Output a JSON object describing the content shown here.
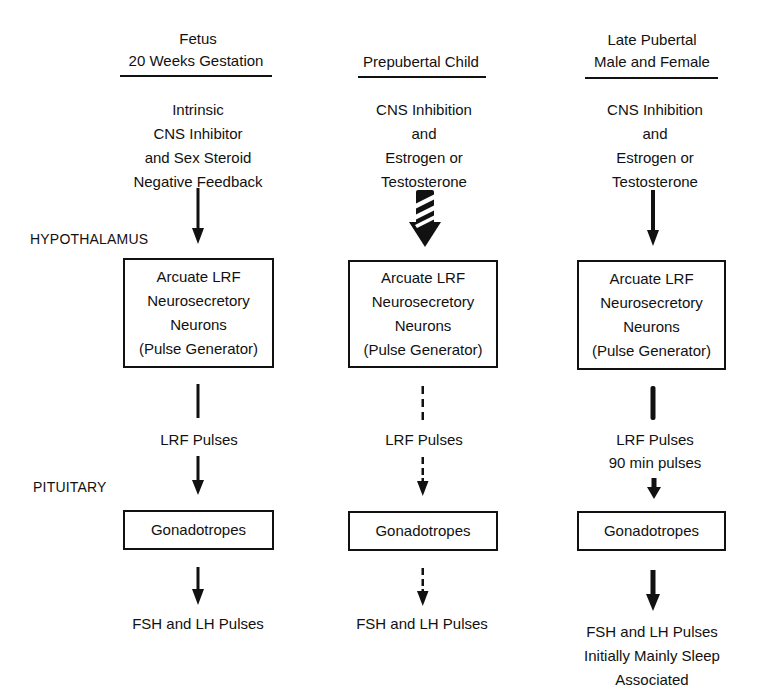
{
  "side_labels": {
    "hypothalamus": "HYPOTHALAMUS",
    "pituitary": "PITUITARY"
  },
  "columns": [
    {
      "id": "fetus",
      "header": [
        "Fetus",
        "20 Weeks Gestation"
      ],
      "input": [
        "Intrinsic",
        "CNS Inhibitor",
        "and Sex Steroid",
        "Negative Feedback"
      ],
      "input_arrow": "solid-thin",
      "neuron_box": [
        "Arcuate LRF",
        "Neurosecretory",
        "Neurons",
        "(Pulse Generator)"
      ],
      "lrf_connector": "solid-thin",
      "lrf_label": [
        "LRF Pulses"
      ],
      "pituitary_arrow": "solid-thin",
      "gonadotropes_box": "Gonadotropes",
      "output_arrow": "solid-thin",
      "output": [
        "FSH and LH Pulses"
      ]
    },
    {
      "id": "prepubertal",
      "header": [
        "Prepubertal Child"
      ],
      "input": [
        "CNS Inhibition",
        "and",
        "Estrogen or",
        "Testosterone"
      ],
      "input_arrow": "heavy-striped",
      "neuron_box": [
        "Arcuate LRF",
        "Neurosecretory",
        "Neurons",
        "(Pulse Generator)"
      ],
      "lrf_connector": "dashed",
      "lrf_label": [
        "LRF Pulses"
      ],
      "pituitary_arrow": "dashed",
      "gonadotropes_box": "Gonadotropes",
      "output_arrow": "dashed",
      "output": [
        "FSH and LH Pulses"
      ]
    },
    {
      "id": "late-pubertal",
      "header": [
        "Late Pubertal",
        "Male and Female"
      ],
      "input": [
        "CNS Inhibition",
        "and",
        "Estrogen or",
        "Testosterone"
      ],
      "input_arrow": "solid-thin",
      "neuron_box": [
        "Arcuate LRF",
        "Neurosecretory",
        "Neurons",
        "(Pulse Generator)"
      ],
      "lrf_connector": "solid-thick",
      "lrf_label": [
        "LRF Pulses",
        "90 min pulses"
      ],
      "pituitary_arrow": "solid-thick",
      "gonadotropes_box": "Gonadotropes",
      "output_arrow": "solid-thick",
      "output": [
        "FSH and LH Pulses",
        "Initially Mainly Sleep",
        "Associated"
      ]
    }
  ]
}
